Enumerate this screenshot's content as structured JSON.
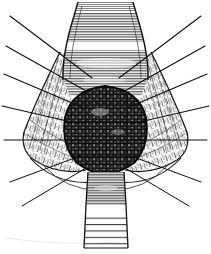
{
  "figure": {
    "style": "monochrome line engraving",
    "background_color": "#ffffff",
    "ink_color": "#1a1a1a",
    "mid_tone_color": "#6e6e6e",
    "light_tone_color": "#b8b8b8",
    "canvas": {
      "width": 211,
      "height": 254
    }
  },
  "parts": {
    "upper_canal": {
      "name": "upper-canal",
      "description": "vertical tubular passage at top with dense horizontal hatching",
      "highlight_band_label": "specular highlight band",
      "top_width": 62,
      "bottom_width": 92
    },
    "central_mass": {
      "name": "central-mass",
      "description": "dark ovoid cross-hatched body occupying the centre",
      "tone": "#2b2b2b"
    },
    "left_wing": {
      "name": "left-tissue-wing",
      "description": "stippled tissue flap spreading to the left",
      "ray_count": 7
    },
    "right_wing": {
      "name": "right-tissue-wing",
      "description": "stippled tissue flap spreading to the right",
      "ray_count": 7
    },
    "lower_band": {
      "name": "lower-band",
      "description": "vertical strip below the central mass with widely spaced horizontal rules",
      "upper_tone": "#5a5a5a",
      "lower_tone": "#ffffff"
    },
    "retractor_rays": {
      "name": "retractor-rays",
      "description": "long straight traction lines radiating outward past the image border",
      "total": 14
    }
  }
}
